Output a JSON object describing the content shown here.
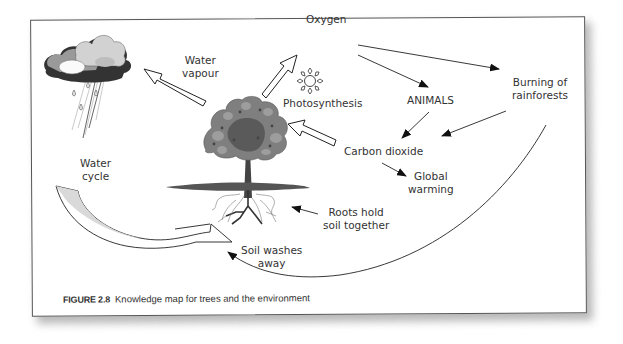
{
  "figure": {
    "number": "FIGURE 2.8",
    "caption": "Knowledge map for trees and the environment"
  },
  "nodes": {
    "water_vapour": "Water\nvapour",
    "oxygen": "Oxygen",
    "photosynthesis": "Photosynthesis",
    "animals": "ANIMALS",
    "burning": "Burning of\nrainforests",
    "carbon_dioxide": "Carbon dioxide",
    "global_warming": "Global\nwarming",
    "water_cycle": "Water\ncycle",
    "roots": "Roots hold\nsoil together",
    "soil_washes": "Soil washes\naway"
  },
  "icons": {
    "cloud": "rain-cloud-icon",
    "sun": "sun-icon",
    "tree": "tree-icon"
  },
  "edges": [
    {
      "from": "tree",
      "to": "water_vapour",
      "style": "hollow-block-arrow"
    },
    {
      "from": "tree",
      "to": "oxygen",
      "style": "hollow-block-arrow"
    },
    {
      "from": "carbon_dioxide",
      "to": "tree",
      "style": "hollow-block-arrow"
    },
    {
      "from": "oxygen",
      "to": "animals",
      "style": "line-arrow"
    },
    {
      "from": "oxygen",
      "to": "burning",
      "style": "line-arrow"
    },
    {
      "from": "animals",
      "to": "carbon_dioxide",
      "style": "line-arrow"
    },
    {
      "from": "burning",
      "to": "carbon_dioxide",
      "style": "line-arrow"
    },
    {
      "from": "carbon_dioxide",
      "to": "global_warming",
      "style": "line-arrow"
    },
    {
      "from": "roots",
      "to": "tree",
      "style": "line-arrow"
    },
    {
      "from": "burning",
      "to": "soil_washes",
      "style": "curved-arrow"
    },
    {
      "from": "water_cycle",
      "to": "soil_washes",
      "style": "curved-block-arrow"
    }
  ],
  "colors": {
    "line": "#222222",
    "text": "#333333",
    "frame": "#555555",
    "foliage": "#7d7d7d",
    "foliage_dark": "#555555",
    "cloud_light": "#d8d8d8",
    "cloud_dark": "#333333",
    "block_arrow_fill": "#d9d9d9"
  }
}
